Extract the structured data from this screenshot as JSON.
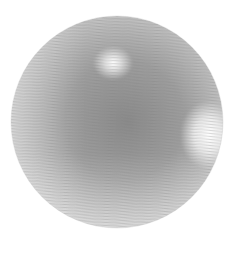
{
  "image": {
    "subject": "shaded sphere",
    "description": "Grayscale 3D sphere with wavy horizontal stripe texture and two specular highlights",
    "background_color": "#ffffff",
    "sphere": {
      "center_x": 117,
      "center_y": 122,
      "radius": 106,
      "base_colors": [
        "#d8d8d8",
        "#b4b4b4",
        "#8c8c8c",
        "#bdbdbd",
        "#d4d4d4"
      ],
      "highlights": [
        {
          "name": "upper-highlight",
          "cx": 113,
          "cy": 63,
          "r": 18,
          "color": "#ffffff"
        },
        {
          "name": "right-highlight",
          "cx": 206,
          "cy": 135,
          "r": 26,
          "color": "#ffffff"
        }
      ],
      "stripe_period_px": 3
    }
  }
}
